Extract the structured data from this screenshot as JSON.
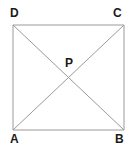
{
  "figure": {
    "type": "geometry-diagram",
    "background_color": "#ffffff",
    "canvas": {
      "width": 131,
      "height": 147
    },
    "style": {
      "line_color": "#9a9a9a",
      "line_width": 1,
      "label_color": "#1a1a1a",
      "label_font_size": 12,
      "label_font_weight": "bold"
    },
    "shape": {
      "name": "square-abcd",
      "vertices": [
        {
          "id": "A",
          "label": "A",
          "x": 13,
          "y": 130,
          "label_x": 10,
          "label_y": 133,
          "corner": "bottom-left"
        },
        {
          "id": "B",
          "label": "B",
          "x": 124,
          "y": 130,
          "label_x": 115,
          "label_y": 133,
          "corner": "bottom-right"
        },
        {
          "id": "C",
          "label": "C",
          "x": 124,
          "y": 25,
          "label_x": 113,
          "label_y": 7,
          "corner": "top-right"
        },
        {
          "id": "D",
          "label": "D",
          "x": 13,
          "y": 25,
          "label_x": 10,
          "label_y": 7,
          "corner": "top-left"
        }
      ],
      "sides": [
        {
          "id": "AB",
          "from": "A",
          "to": "B"
        },
        {
          "id": "BC",
          "from": "B",
          "to": "C"
        },
        {
          "id": "CD",
          "from": "C",
          "to": "D"
        },
        {
          "id": "DA",
          "from": "D",
          "to": "A"
        }
      ],
      "diagonals": [
        {
          "id": "AC",
          "from": "A",
          "to": "C"
        },
        {
          "id": "BD",
          "from": "B",
          "to": "D"
        }
      ],
      "intersection": {
        "id": "P",
        "label": "P",
        "x": 69,
        "y": 78,
        "label_x": 65,
        "label_y": 57
      }
    }
  }
}
